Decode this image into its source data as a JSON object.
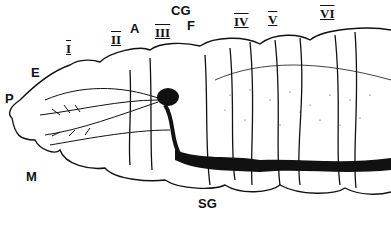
{
  "figure": {
    "labels": {
      "P": "P",
      "E": "E",
      "M": "M",
      "A": "A",
      "CG": "CG",
      "F": "F",
      "SG": "SG"
    },
    "segments": [
      "I",
      "II",
      "III",
      "IV",
      "V",
      "VI"
    ],
    "colors": {
      "ink": "#111111",
      "background": "#ffffff"
    }
  }
}
